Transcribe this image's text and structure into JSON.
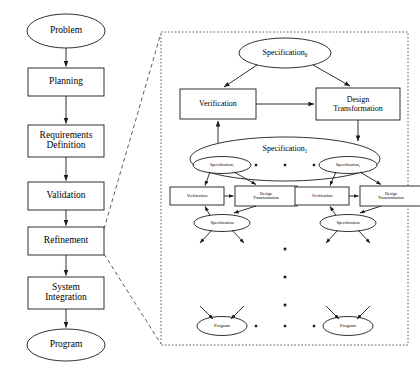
{
  "diagram": {
    "left_flow": {
      "name": "waterfall-process-flow",
      "nodes": [
        {
          "id": "problem",
          "shape": "ellipse",
          "label": "Problem",
          "x": 66,
          "y": 31,
          "w": 78,
          "h": 34
        },
        {
          "id": "planning",
          "shape": "box",
          "label": "Planning",
          "x": 66,
          "y": 82,
          "w": 76,
          "h": 28
        },
        {
          "id": "requirements",
          "shape": "box",
          "label": "Requirements\nDefinition",
          "x": 66,
          "y": 141,
          "w": 76,
          "h": 32
        },
        {
          "id": "validation",
          "shape": "box",
          "label": "Validation",
          "x": 66,
          "y": 196,
          "w": 76,
          "h": 28
        },
        {
          "id": "refinement",
          "shape": "box",
          "label": "Refinement",
          "x": 66,
          "y": 241,
          "w": 76,
          "h": 28
        },
        {
          "id": "integration",
          "shape": "box",
          "label": "System\nIntegration",
          "x": 66,
          "y": 293,
          "w": 76,
          "h": 32
        },
        {
          "id": "program",
          "shape": "ellipse",
          "label": "Program",
          "x": 66,
          "y": 345,
          "w": 78,
          "h": 32
        }
      ]
    },
    "detail_panel": {
      "name": "refinement-detail-panel",
      "bounds": {
        "x": 161,
        "y": 32,
        "w": 247,
        "h": 313
      },
      "level0": {
        "spec": {
          "label": "Specification",
          "subscript": "0",
          "x": 285,
          "y": 53,
          "w": 92,
          "h": 30
        },
        "verification": {
          "label": "Verification",
          "x": 218,
          "y": 104,
          "w": 76,
          "h": 30
        },
        "design_transformation": {
          "label": "Design\nTransformation",
          "x": 358,
          "y": 104,
          "w": 84,
          "h": 32
        }
      },
      "level1": {
        "spec_group": {
          "label": "Specification",
          "subscript": "1",
          "x": 285,
          "y": 159,
          "w": 190,
          "h": 44
        },
        "children": [
          {
            "label": "Specification",
            "subscript": "1",
            "x": 222,
            "y": 165,
            "w": 58,
            "h": 17
          },
          {
            "label": "Specification",
            "subscript": "k",
            "x": 348,
            "y": 165,
            "w": 58,
            "h": 17
          }
        ],
        "ellipsis_dots": [
          {
            "x": 256,
            "y": 165
          },
          {
            "x": 285,
            "y": 165
          },
          {
            "x": 314,
            "y": 165
          }
        ],
        "branches": [
          {
            "verification": {
              "label": "Verification",
              "x": 197,
              "y": 196,
              "w": 54,
              "h": 18
            },
            "design_transformation": {
              "label": "Design\nTransformation",
              "x": 266,
              "y": 196,
              "w": 62,
              "h": 20
            },
            "spec": {
              "label": "Specification",
              "subscript": "",
              "x": 222,
              "y": 223,
              "w": 56,
              "h": 17
            }
          },
          {
            "verification": {
              "label": "Verification",
              "x": 322,
              "y": 196,
              "w": 54,
              "h": 18
            },
            "design_transformation": {
              "label": "Design\nTransformation",
              "x": 391,
              "y": 196,
              "w": 62,
              "h": 20
            },
            "spec": {
              "label": "Specification",
              "subscript": "",
              "x": 348,
              "y": 223,
              "w": 56,
              "h": 17
            }
          }
        ]
      },
      "vertical_dots": [
        {
          "x": 285,
          "y": 249
        },
        {
          "x": 285,
          "y": 277
        },
        {
          "x": 285,
          "y": 305
        }
      ],
      "programs": [
        {
          "label": "Program",
          "x": 222,
          "y": 326,
          "w": 50,
          "h": 19
        },
        {
          "label": "Program",
          "x": 348,
          "y": 326,
          "w": 50,
          "h": 19
        }
      ],
      "program_ellipsis_dots": [
        {
          "x": 256,
          "y": 326
        },
        {
          "x": 285,
          "y": 326
        },
        {
          "x": 314,
          "y": 326
        }
      ]
    },
    "zoom_connectors": {
      "name": "expansion-callout-lines",
      "style": "dashed",
      "lines": [
        {
          "x1": 104,
          "y1": 229,
          "x2": 161,
          "y2": 33
        },
        {
          "x1": 104,
          "y1": 254,
          "x2": 161,
          "y2": 344
        }
      ]
    },
    "colors": {
      "stroke": "#1a1a1a",
      "panel_border": "#4d4d4d",
      "background": "#ffffff",
      "text": "#000000"
    }
  }
}
